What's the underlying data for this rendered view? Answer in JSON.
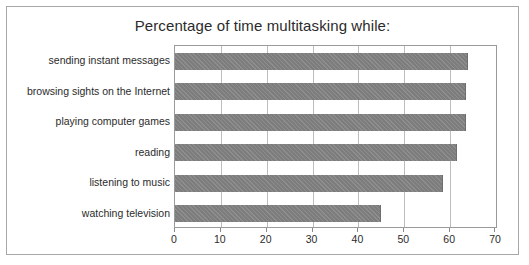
{
  "chart_data": {
    "type": "bar",
    "orientation": "horizontal",
    "title": "Percentage of time multitasking while:",
    "xlabel": "",
    "ylabel": "",
    "categories": [
      "sending instant messages",
      "browsing sights on the Internet",
      "playing computer games",
      "reading",
      "listening to music",
      "watching television"
    ],
    "values": [
      64,
      63.5,
      63.5,
      61.5,
      58.5,
      45
    ],
    "xlim": [
      0,
      70
    ],
    "xticks": [
      0,
      10,
      20,
      30,
      40,
      50,
      60,
      70
    ],
    "xtick_labels": [
      "0",
      "10",
      "20",
      "30",
      "40",
      "50",
      "60",
      "70"
    ],
    "grid": "vertical",
    "legend": "none",
    "bar_color": "#7d7d7d",
    "plot_border_color": "#9a9a9a",
    "gridline_color": "#bdbdbd",
    "figure_border_color": "#a8a8a8",
    "text_color": "#2b2b2b",
    "background_color": "#ffffff"
  }
}
